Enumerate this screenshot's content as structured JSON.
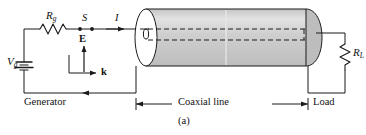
{
  "figure": {
    "caption": "(a)",
    "background_color": "#ffffff",
    "line_color": "#1a1a1a",
    "cylinder_body_color": "#c9c9c9",
    "cylinder_highlight_color": "#dcdcdc",
    "cylinder_endcap_color": "#ffffff",
    "cylinder_right_cap_color": "#bfbfbf"
  },
  "labels": {
    "source": {
      "base": "V",
      "sub": "g",
      "name": "generator-voltage-source"
    },
    "series_resistor": {
      "base": "R",
      "sub": "g",
      "name": "generator-resistance"
    },
    "switch": {
      "text": "S",
      "name": "switch"
    },
    "current": {
      "text": "I",
      "name": "current"
    },
    "e_field": {
      "text": "E",
      "name": "electric-field-vector"
    },
    "k_vector": {
      "text": "k",
      "name": "wave-vector"
    },
    "load_resistor": {
      "base": "R",
      "sub": "L",
      "name": "load-resistance"
    },
    "generator_region": {
      "text": "Generator",
      "name": "generator-region"
    },
    "line_region": {
      "text": "Coaxial line",
      "name": "coaxial-line-region"
    },
    "load_region": {
      "text": "Load",
      "name": "load-region"
    }
  }
}
